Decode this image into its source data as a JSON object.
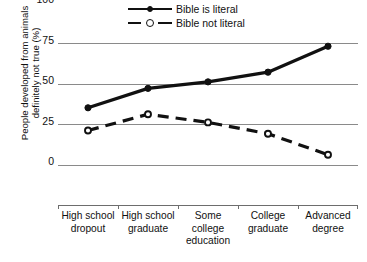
{
  "chart_data": {
    "type": "line",
    "title": "",
    "xlabel": "",
    "ylabel": "People developed from animals definitely not true (%)",
    "ylabel_line1": "People developed from animals",
    "ylabel_line2": "definitely not true (%)",
    "categories": [
      "High school dropout",
      "High school graduate",
      "Some college education",
      "College graduate",
      "Advanced degree"
    ],
    "category_lines": [
      [
        "High school",
        "dropout"
      ],
      [
        "High school",
        "graduate"
      ],
      [
        "Some",
        "college",
        "education"
      ],
      [
        "College",
        "graduate"
      ],
      [
        "Advanced",
        "degree"
      ]
    ],
    "series": [
      {
        "name": "Bible is literal",
        "values": [
          60,
          72,
          76,
          82,
          98
        ],
        "line_style": "solid",
        "marker": "filled-circle",
        "color": "#111111"
      },
      {
        "name": "Bible not literal",
        "values": [
          46,
          56,
          51,
          44,
          31
        ],
        "line_style": "dashed",
        "marker": "open-circle",
        "color": "#111111"
      }
    ],
    "ylim": [
      0,
      100
    ],
    "yticks": [
      0,
      25,
      50,
      75,
      100
    ],
    "ytick_labels": [
      "0",
      "25",
      "50",
      "75",
      "100"
    ],
    "grid": true,
    "legend_position": "top-center"
  },
  "legend": {
    "items": [
      {
        "label": "Bible is literal"
      },
      {
        "label": "Bible not literal"
      }
    ]
  },
  "caption": {
    "text": ""
  }
}
